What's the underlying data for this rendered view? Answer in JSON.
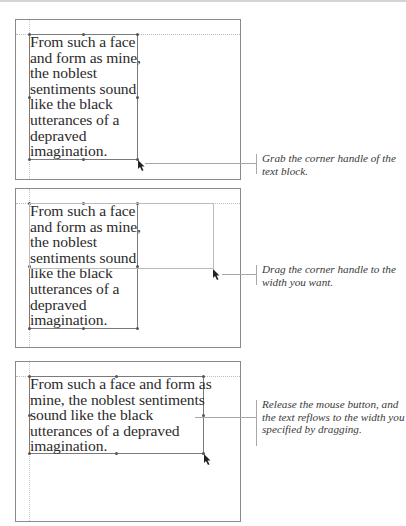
{
  "figure": {
    "steps": [
      {
        "id": "step-1",
        "text_lines": [
          "From such a face",
          "and form as mine,",
          "the noblest",
          "sentiments sound",
          "like the black",
          "utterances of a",
          "depraved",
          "imagination."
        ],
        "caption": "Grab the corner handle of the text block."
      },
      {
        "id": "step-2",
        "text_lines": [
          "From such a face",
          "and form as mine,",
          "the noblest",
          "sentiments sound",
          "like the black",
          "utterances of a",
          "depraved",
          "imagination."
        ],
        "caption": "Drag the corner handle to the width you want."
      },
      {
        "id": "step-3",
        "text_lines": [
          "From such a face and form as",
          "mine, the noblest sentiments",
          "sound like the black",
          "utterances of a depraved",
          "imagination."
        ],
        "caption": "Release the mouse button, and the text reflows to the width you specified by dragging."
      }
    ],
    "colors": {
      "panel_border": "#8a8a8a",
      "text": "#2b2b2b",
      "caption": "#3a3a3a",
      "guide": "#bdbdbd"
    }
  }
}
